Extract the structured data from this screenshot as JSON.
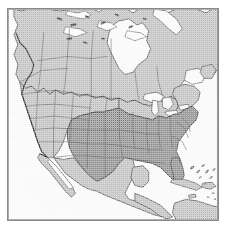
{
  "figure": {
    "kind": "map-image",
    "projection_hint": "conic",
    "frame": {
      "border_color": "#8a8a8a",
      "border_width_px": 1,
      "background_color": "#ffffff"
    }
  },
  "legend": {
    "visible": false,
    "entries": [
      {
        "label": "Highlighted states",
        "color": "#9b9b9b"
      },
      {
        "label": "Other land",
        "color": "#c9c9c9"
      },
      {
        "label": "Water",
        "color": "#fbfbfb"
      }
    ]
  },
  "colors": {
    "water": "#fbfbfb",
    "land_light": "#c9c9c9",
    "land_dark": "#9b9b9b",
    "coastline": "#2b2b2b",
    "internal_border": "#5a5a5a",
    "frame": "#8a8a8a",
    "page_background": "#ffffff"
  },
  "regions": {
    "water_bodies": [
      "Pacific Ocean",
      "Atlantic Ocean",
      "Gulf of Mexico",
      "Hudson Bay",
      "Great Lakes",
      "Gulf of California",
      "Caribbean Sea",
      "Baffin Bay"
    ],
    "countries": [
      "Canada",
      "United States",
      "Mexico",
      "Cuba",
      "Bahamas",
      "Hispaniola",
      "Guatemala",
      "Honduras",
      "Nicaragua",
      "Colombia",
      "Venezuela"
    ],
    "highlighted_label": "Shaded (darker) United States states",
    "highlighted_states": [
      "Texas",
      "Oklahoma",
      "Kansas",
      "Missouri",
      "Arkansas",
      "Louisiana",
      "Mississippi",
      "Alabama",
      "Tennessee",
      "Kentucky",
      "Illinois",
      "Indiana",
      "Ohio",
      "West Virginia",
      "Virginia",
      "North Carolina",
      "South Carolina",
      "Georgia",
      "Florida"
    ],
    "unhighlighted_states": [
      "Washington",
      "Oregon",
      "California",
      "Nevada",
      "Idaho",
      "Montana",
      "Wyoming",
      "Utah",
      "Arizona",
      "New Mexico",
      "Colorado",
      "North Dakota",
      "South Dakota",
      "Nebraska",
      "Minnesota",
      "Iowa",
      "Wisconsin",
      "Michigan",
      "Pennsylvania",
      "New York",
      "Maine"
    ],
    "canadian_provinces": [
      "British Columbia",
      "Alberta",
      "Saskatchewan",
      "Manitoba",
      "Ontario",
      "Quebec",
      "Newfoundland and Labrador",
      "Nunavut",
      "Northwest Territories",
      "Yukon"
    ]
  }
}
